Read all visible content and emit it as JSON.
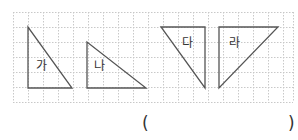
{
  "grid": {
    "x": 13,
    "y": 12,
    "width": 280,
    "height": 90,
    "cell": 15,
    "line_color": "#c8c8c8"
  },
  "triangles": [
    {
      "label": "가",
      "points": "28,27 28,88 72,88",
      "label_x": 36,
      "label_y": 66
    },
    {
      "label": "나",
      "points": "87,42 87,88 146,88",
      "label_x": 94,
      "label_y": 66
    },
    {
      "label": "다",
      "points": "161,27 205,27 205,88",
      "label_x": 185,
      "label_y": 43
    },
    {
      "label": "라",
      "points": "219,27 278,27 219,88",
      "label_x": 229,
      "label_y": 43
    }
  ],
  "stroke_color": "#555555",
  "answer": {
    "open_paren": "(",
    "close_paren": ")",
    "value": ""
  }
}
